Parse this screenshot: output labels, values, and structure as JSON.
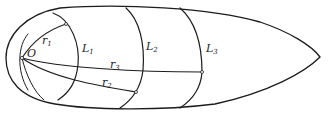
{
  "diagram": {
    "type": "geometric-figure",
    "colors": {
      "stroke": "#1c1c1c",
      "background": "#ffffff",
      "shading": "#9a9a9a"
    },
    "labels": {
      "origin": "O",
      "r1": {
        "base": "r",
        "sub": "1"
      },
      "r2": {
        "base": "r",
        "sub": "2"
      },
      "r3": {
        "base": "r",
        "sub": "3"
      },
      "L1": {
        "base": "L",
        "sub": "1"
      },
      "L2": {
        "base": "L",
        "sub": "2"
      },
      "L3": {
        "base": "L",
        "sub": "3"
      }
    },
    "elements": [
      {
        "id": "body-outline",
        "kind": "closed-curve",
        "shape": "ogive (rounded left, pointed right)"
      },
      {
        "id": "origin",
        "kind": "point",
        "label": "O",
        "at": [
          22,
          58
        ]
      },
      {
        "id": "r1",
        "kind": "curve",
        "from": "O",
        "to": "L1 upper point"
      },
      {
        "id": "r2",
        "kind": "curve",
        "from": "O",
        "to": "L2 lower point"
      },
      {
        "id": "r3",
        "kind": "curve",
        "from": "O",
        "to": "L3 middle point"
      },
      {
        "id": "L1",
        "kind": "arc",
        "note": "cross-section curve nearest origin"
      },
      {
        "id": "L2",
        "kind": "arc",
        "note": "middle cross-section curve"
      },
      {
        "id": "L3",
        "kind": "arc",
        "note": "cross-section curve nearest tip"
      }
    ]
  }
}
